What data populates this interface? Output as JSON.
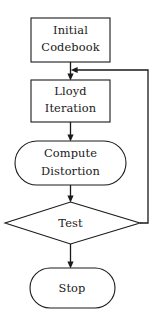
{
  "diagram": {
    "background_color": "#ffffff",
    "stroke_color": "#1a1a1a",
    "nodes": [
      {
        "id": "initial-codebook",
        "shape": "rectangle",
        "line1": "Initial",
        "line2": "Codebook"
      },
      {
        "id": "lloyd-iteration",
        "shape": "rectangle",
        "line1": "Lloyd",
        "line2": "Iteration"
      },
      {
        "id": "compute-distortion",
        "shape": "stadium",
        "line1": "Compute",
        "line2": "Distortion"
      },
      {
        "id": "test",
        "shape": "diamond",
        "line1": "Test"
      },
      {
        "id": "stop",
        "shape": "stadium",
        "line1": "Stop"
      }
    ],
    "edges": [
      {
        "id": "initial-to-lloyd",
        "from": "initial-codebook",
        "to": "lloyd-iteration",
        "label": ""
      },
      {
        "id": "lloyd-to-distortion",
        "from": "lloyd-iteration",
        "to": "compute-distortion",
        "label": ""
      },
      {
        "id": "distortion-to-test",
        "from": "compute-distortion",
        "to": "test",
        "label": ""
      },
      {
        "id": "test-to-stop",
        "from": "test",
        "to": "stop",
        "label": ""
      },
      {
        "id": "test-feedback-to-lloyd",
        "from": "test",
        "to": "lloyd-iteration",
        "label": ""
      }
    ]
  }
}
